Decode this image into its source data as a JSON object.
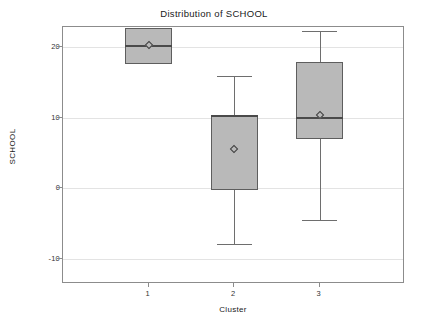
{
  "chart_data": {
    "type": "box",
    "title": "Distribution of SCHOOL",
    "xlabel": "Cluster",
    "ylabel": "SCHOOL",
    "grid": true,
    "legend": "none",
    "ylim": [
      -13.5,
      22.8
    ],
    "yticks": [
      -10,
      0,
      10,
      20
    ],
    "ytick_labels": [
      "-10",
      "0",
      "10",
      "20"
    ],
    "categories": [
      "1",
      "2",
      "3"
    ],
    "boxes": [
      {
        "category": "1",
        "whisker_low": 17.6,
        "q1": 17.6,
        "median": 20.1,
        "q3": 22.6,
        "whisker_high": 22.6,
        "mean": 20.2
      },
      {
        "category": "2",
        "whisker_low": -7.8,
        "q1": -0.2,
        "median": 10.2,
        "q3": 10.3,
        "whisker_high": 15.9,
        "mean": 5.6
      },
      {
        "category": "3",
        "whisker_low": -4.5,
        "q1": 7.0,
        "median": 9.9,
        "q3": 17.8,
        "whisker_high": 22.2,
        "mean": 10.4
      }
    ],
    "colors": {
      "box_fill": "#b9b9b9",
      "box_edge": "#5e5e5e",
      "median": "#4a4a4a",
      "whisker": "#6e6e6e",
      "mean_marker": "#3d3d3d",
      "grid": "#e3e3e3",
      "frame": "#8c8c8c",
      "background": "#ffffff"
    }
  }
}
